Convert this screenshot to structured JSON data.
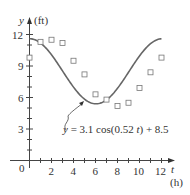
{
  "chart_data": {
    "type": "scatter",
    "title": "",
    "xlabel": "t",
    "xunit": "(h)",
    "ylabel": "y",
    "yunit": "(ft)",
    "xlim": [
      0,
      12.5
    ],
    "ylim": [
      0,
      12.5
    ],
    "x_ticks": [
      2,
      4,
      6,
      8,
      10,
      12
    ],
    "y_ticks": [
      3,
      6,
      9,
      12
    ],
    "origin_label": "0",
    "grid": false,
    "series": [
      {
        "name": "data",
        "type": "scatter",
        "marker": "open-square",
        "x": [
          0,
          1,
          2,
          3,
          4,
          5,
          6,
          7,
          8,
          9,
          10,
          11,
          12
        ],
        "y": [
          9.8,
          11.3,
          11.5,
          11.2,
          9.5,
          8.2,
          6.3,
          5.8,
          5.2,
          5.5,
          6.9,
          8.4,
          9.8
        ]
      },
      {
        "name": "model",
        "type": "line",
        "equation": "y = 3.1 cos(0.52 t) + 8.5",
        "amplitude": 3.1,
        "frequency": 0.52,
        "offset": 8.5
      }
    ],
    "annotation": {
      "text": "y = 3.1 cos(0.52 t) + 8.5",
      "points_to": "model curve near t = 5.5"
    }
  },
  "labels": {
    "y_axis": "y",
    "y_unit": "(ft)",
    "x_axis": "t",
    "x_unit": "(h)",
    "origin": "0",
    "x_tick_2": "2",
    "x_tick_4": "4",
    "x_tick_6": "6",
    "x_tick_8": "8",
    "x_tick_10": "10",
    "x_tick_12": "12",
    "y_tick_3": "3",
    "y_tick_6": "6",
    "y_tick_9": "9",
    "y_tick_12": "12",
    "equation_y": "y",
    "equation_rest": " = 3.1 cos(0.52 ",
    "equation_t": "t",
    "equation_tail": ") + 8.5"
  },
  "colors": {
    "curve": "#666666",
    "axis": "#444444",
    "marker": "#777777"
  }
}
